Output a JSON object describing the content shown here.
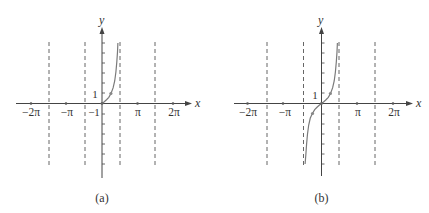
{
  "figure": {
    "panels": [
      {
        "id": "a",
        "caption": "(a)",
        "x_axis_label": "x",
        "y_axis_label": "y",
        "x_tick_labels": [
          "−2π",
          "−π",
          "π",
          "2π"
        ],
        "y_tick_labels": [
          "1",
          "−1"
        ],
        "function": "tan x, 0 ≤ x < π/2",
        "asymptotes": [
          "−3π/2",
          "−π/2",
          "π/2",
          "3π/2"
        ],
        "marked_points": [
          [
            0,
            0
          ],
          [
            "π/4",
            1
          ]
        ]
      },
      {
        "id": "b",
        "caption": "(b)",
        "x_axis_label": "x",
        "y_axis_label": "y",
        "x_tick_labels": [
          "−2π",
          "−π",
          "π",
          "2π"
        ],
        "y_tick_labels": [
          "1"
        ],
        "function": "tan x, −π/2 < x < π/2",
        "asymptotes": [
          "−3π/2",
          "−π/2",
          "π/2",
          "3π/2"
        ],
        "marked_points": [
          [
            "−π/4",
            -1
          ],
          [
            0,
            0
          ],
          [
            "π/4",
            1
          ]
        ]
      }
    ]
  },
  "colors": {
    "axis": "#444444",
    "curve": "#7a7a7a",
    "asymptote": "#555555",
    "text": "#333333"
  }
}
